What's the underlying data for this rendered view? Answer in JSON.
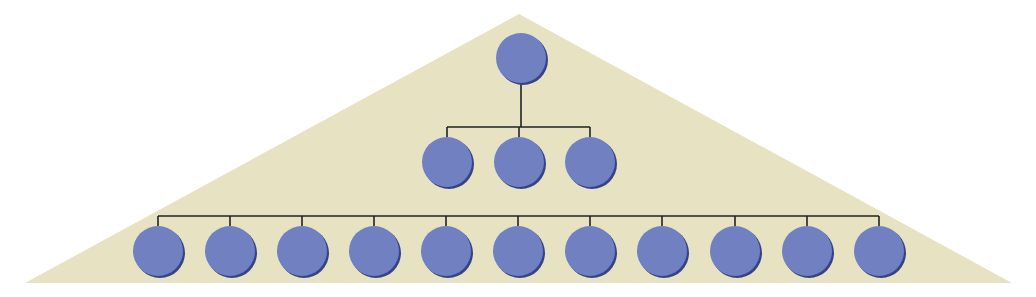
{
  "diagram": {
    "type": "hierarchy-pyramid",
    "colors": {
      "background": "#ffffff",
      "triangle": "#e6e2c2",
      "node_fill": "#7080c0",
      "node_shadow": "#34448a",
      "connector": "#222222"
    },
    "triangle": {
      "apex": [
        519,
        14
      ],
      "left": [
        25,
        283
      ],
      "right": [
        1012,
        283
      ]
    },
    "node_radius": 25,
    "levels": [
      {
        "name": "level-1",
        "y": 58,
        "x": [
          521
        ]
      },
      {
        "name": "level-2",
        "y": 162,
        "x": [
          447,
          519,
          590
        ]
      },
      {
        "name": "level-3",
        "y": 251,
        "x": [
          158,
          230,
          302,
          374,
          446,
          518,
          590,
          662,
          735,
          807,
          879
        ]
      }
    ],
    "connectors": {
      "level1_to_level2": {
        "stem_top": 84,
        "bar_y": 127,
        "drop_to": 137
      },
      "level2_to_level3": {
        "stem_from_level": "top-to-bar",
        "bar_y": 216,
        "drop_to": 226
      }
    }
  }
}
